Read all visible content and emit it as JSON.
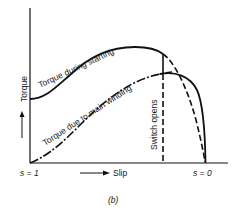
{
  "diagram": {
    "type": "torque-slip curve",
    "y_axis_label": "Torque",
    "x_axis_label": "Slip",
    "x_left_label": "s = 1",
    "x_right_label": "s = 0",
    "curves": [
      {
        "name": "starting",
        "label": "Torque during starting",
        "style": "solid"
      },
      {
        "name": "main-winding",
        "label": "Torque due to main winding",
        "style": "dash-dot"
      }
    ],
    "switch_label": "Switch opens",
    "caption": "(b)"
  }
}
